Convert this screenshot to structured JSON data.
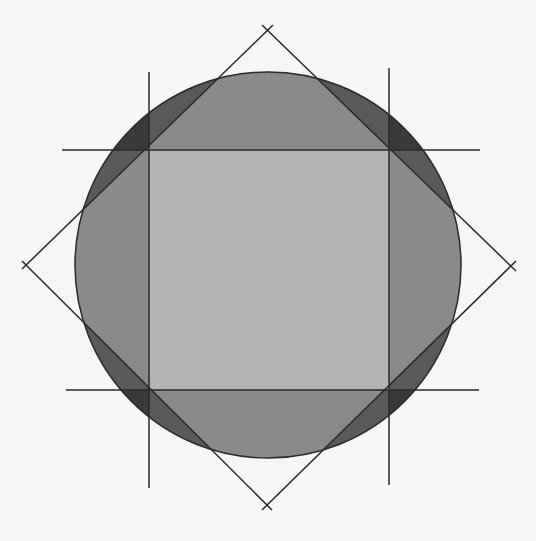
{
  "diagram": {
    "title": "",
    "colors": {
      "background": "#f6f6f6",
      "circle_fill": "#8a8a8a",
      "square_fill": "#b4b4b4",
      "overlap_dark": "#5a5a5a",
      "corner_darkest": "#3a3a3a",
      "line": "#2a2a2a"
    },
    "circle": {
      "cx": 268,
      "cy": 265,
      "r": 193
    },
    "square": {
      "x1": 149,
      "y1": 150,
      "x2": 389,
      "y2": 390
    },
    "diamond": {
      "top": [
        268,
        30
      ],
      "right": [
        511,
        266
      ],
      "bottom": [
        267,
        505
      ],
      "left": [
        26,
        265
      ]
    },
    "construction_lines": {
      "vertical": [
        {
          "x": 149,
          "y1": 72,
          "y2": 488
        },
        {
          "x": 389,
          "y1": 68,
          "y2": 485
        }
      ],
      "horizontal": [
        {
          "y": 150,
          "x1": 62,
          "x2": 480
        },
        {
          "y": 390,
          "x1": 66,
          "x2": 479
        }
      ]
    },
    "labels": []
  }
}
